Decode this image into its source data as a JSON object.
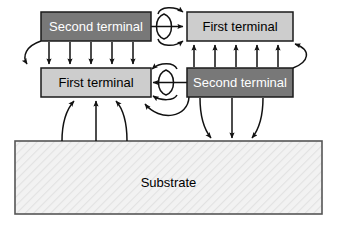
{
  "diagram": {
    "type": "block-diagram",
    "canvas": {
      "width": 337,
      "height": 228,
      "background": "#ffffff"
    },
    "boxes": [
      {
        "id": "top-second-terminal",
        "label": "Second terminal",
        "role": "second-terminal",
        "row": "top",
        "column": "left",
        "fill": "#787878",
        "text_color": "#ffffff",
        "border_color": "#1a1a1a",
        "x": 41,
        "y": 12,
        "width": 110,
        "height": 29
      },
      {
        "id": "top-first-terminal",
        "label": "First terminal",
        "role": "first-terminal",
        "row": "top",
        "column": "right",
        "fill": "#cdcdcd",
        "text_color": "#000000",
        "border_color": "#1a1a1a",
        "x": 187,
        "y": 12,
        "width": 106,
        "height": 29
      },
      {
        "id": "mid-first-terminal",
        "label": "First terminal",
        "role": "first-terminal",
        "row": "middle",
        "column": "left",
        "fill": "#cdcdcd",
        "text_color": "#000000",
        "border_color": "#1a1a1a",
        "x": 41,
        "y": 68,
        "width": 110,
        "height": 29
      },
      {
        "id": "mid-second-terminal",
        "label": "Second terminal",
        "role": "second-terminal",
        "row": "middle",
        "column": "right",
        "fill": "#787878",
        "text_color": "#ffffff",
        "border_color": "#1a1a1a",
        "x": 187,
        "y": 68,
        "width": 106,
        "height": 29
      },
      {
        "id": "substrate",
        "label": "Substrate",
        "role": "substrate",
        "row": "bottom",
        "column": "full",
        "fill": "#f2f2f2",
        "text_color": "#000000",
        "border_color": "#555555",
        "x": 15,
        "y": 141,
        "width": 307,
        "height": 73
      }
    ],
    "arrow_groups": [
      {
        "id": "top-to-mid-left",
        "label": "downward field lines",
        "count": 5,
        "direction": "down",
        "style": "straight"
      },
      {
        "id": "top-to-mid-left-curve",
        "label": "left curved return",
        "count": 1,
        "direction": "down",
        "style": "curved"
      },
      {
        "id": "mid-to-top-right",
        "label": "upward field lines",
        "count": 5,
        "direction": "up",
        "style": "straight"
      },
      {
        "id": "mid-to-top-right-curve",
        "label": "right curved return",
        "count": 1,
        "direction": "up",
        "style": "curved"
      },
      {
        "id": "substrate-to-mid-left",
        "label": "upward substrate coupling",
        "count": 3,
        "direction": "up",
        "style": "mixed"
      },
      {
        "id": "mid-right-to-substrate",
        "label": "downward substrate coupling",
        "count": 3,
        "direction": "down",
        "style": "mixed"
      },
      {
        "id": "top-gap-center",
        "label": "left to right terminal coupling",
        "count": 1,
        "direction": "right",
        "style": "straight"
      },
      {
        "id": "top-gap-loops",
        "label": "fringing loops top row",
        "count": 2,
        "direction": "right",
        "style": "curved"
      },
      {
        "id": "mid-gap-center",
        "label": "right to left terminal coupling",
        "count": 1,
        "direction": "left",
        "style": "straight"
      },
      {
        "id": "mid-gap-loops",
        "label": "fringing loops middle row",
        "count": 2,
        "direction": "left",
        "style": "curved"
      },
      {
        "id": "mid-lower-return",
        "label": "lower return loop",
        "count": 1,
        "direction": "left",
        "style": "curved"
      }
    ],
    "colors": {
      "second_terminal_fill": "#787878",
      "first_terminal_fill": "#cdcdcd",
      "substrate_fill": "#f2f2f2",
      "arrow_stroke": "#111111",
      "box_border": "#1a1a1a",
      "substrate_border": "#555555"
    }
  }
}
